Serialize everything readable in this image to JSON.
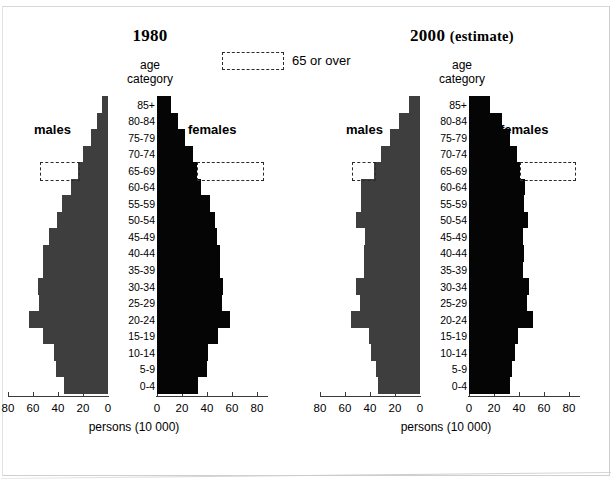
{
  "legend": {
    "label": "65 or over",
    "style": "dashed-box"
  },
  "axis": {
    "category_header_line1": "age",
    "category_header_line2": "category",
    "x_title": "persons (10 000)",
    "male_ticks": [
      80,
      60,
      40,
      20,
      0
    ],
    "female_ticks": [
      0,
      20,
      40,
      60,
      80
    ],
    "max": 80,
    "male_label": "males",
    "female_label": "females"
  },
  "colors": {
    "male_bar": "#3e3e3e",
    "female_bar": "#050505",
    "dash": "#2b2b2b"
  },
  "panels": [
    {
      "id": "panel-1980",
      "title": "1980",
      "title_sub": ""
    },
    {
      "id": "panel-2000",
      "title": "2000",
      "title_sub": "(estimate)"
    }
  ],
  "chart_data": [
    {
      "type": "bar",
      "title": "1980",
      "subtitle": "",
      "orientation": "horizontal-pyramid",
      "xlabel": "persons (10 000)",
      "ylabel": "age category",
      "xlim": [
        0,
        80
      ],
      "grid": false,
      "legend": "65 or over",
      "legend_position": "top-center",
      "categories": [
        "85+",
        "80-84",
        "75-79",
        "70-74",
        "65-69",
        "60-64",
        "55-59",
        "50-54",
        "45-49",
        "40-44",
        "35-39",
        "30-34",
        "25-29",
        "20-24",
        "15-19",
        "10-14",
        "5-9",
        "0-4"
      ],
      "series": [
        {
          "name": "males",
          "values": [
            5,
            9,
            14,
            20,
            24,
            30,
            37,
            41,
            47,
            52,
            52,
            56,
            55,
            63,
            52,
            43,
            42,
            35
          ]
        },
        {
          "name": "females",
          "values": [
            11,
            17,
            22,
            29,
            32,
            35,
            42,
            46,
            48,
            50,
            50,
            53,
            52,
            58,
            49,
            41,
            40,
            33
          ]
        }
      ],
      "highlight_rows": [
        "65-69",
        "70-74",
        "75-79",
        "80-84",
        "85+"
      ]
    },
    {
      "type": "bar",
      "title": "2000",
      "subtitle": "(estimate)",
      "orientation": "horizontal-pyramid",
      "xlabel": "persons (10 000)",
      "ylabel": "age category",
      "xlim": [
        0,
        80
      ],
      "grid": false,
      "legend": "65 or over",
      "legend_position": "top-center",
      "categories": [
        "85+",
        "80-84",
        "75-79",
        "70-74",
        "65-69",
        "60-64",
        "55-59",
        "50-54",
        "45-49",
        "40-44",
        "35-39",
        "30-34",
        "25-29",
        "20-24",
        "15-19",
        "10-14",
        "5-9",
        "0-4"
      ],
      "series": [
        {
          "name": "males",
          "values": [
            9,
            17,
            24,
            31,
            37,
            47,
            47,
            51,
            44,
            45,
            45,
            51,
            48,
            55,
            41,
            39,
            35,
            34
          ]
        },
        {
          "name": "females",
          "values": [
            17,
            26,
            33,
            38,
            41,
            45,
            44,
            47,
            43,
            44,
            43,
            48,
            46,
            51,
            39,
            37,
            34,
            33
          ]
        }
      ],
      "highlight_rows": [
        "65-69",
        "70-74",
        "75-79",
        "80-84",
        "85+"
      ]
    }
  ]
}
